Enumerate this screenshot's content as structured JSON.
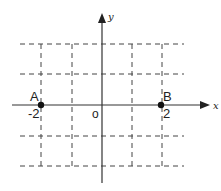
{
  "diagram": {
    "type": "coordinate-plane",
    "axes": {
      "x_label": "x",
      "y_label": "y",
      "origin_label": "o"
    },
    "points": [
      {
        "name": "A",
        "value_label": "-2",
        "x": -2,
        "y": 0
      },
      {
        "name": "B",
        "value_label": "2",
        "x": 2,
        "y": 0
      }
    ],
    "grid": {
      "style": "dashed",
      "x_lines": [
        -2,
        -1,
        1,
        2
      ],
      "y_lines": [
        -2,
        -1,
        1,
        2
      ]
    },
    "colors": {
      "line": "#333333",
      "grid": "#444444",
      "background": "#ffffff"
    }
  }
}
